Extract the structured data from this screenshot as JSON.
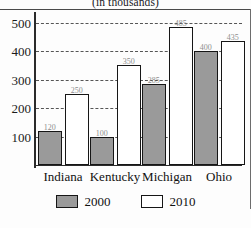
{
  "subtitle": "(in thousands)",
  "legend": [
    {
      "label": "2000",
      "swatch": "filled-gray-swatch"
    },
    {
      "label": "2010",
      "swatch": "empty-white-swatch"
    }
  ],
  "chart_data": {
    "type": "bar",
    "title": "",
    "subtitle": "(in thousands)",
    "categories": [
      "Indiana",
      "Kentucky",
      "Michigan",
      "Ohio"
    ],
    "series": [
      {
        "name": "2000",
        "values": [
          120,
          100,
          285,
          400
        ],
        "color": "#9a9a9a"
      },
      {
        "name": "2010",
        "values": [
          250,
          350,
          485,
          435
        ],
        "color": "#ffffff"
      }
    ],
    "xlabel": "",
    "ylabel": "",
    "ylim": [
      0,
      530
    ],
    "yticks": [
      100,
      200,
      300,
      400,
      500
    ],
    "ytick_labels": [
      "100",
      "200",
      "300",
      "400",
      "500"
    ],
    "grid": true,
    "grid_style": "dashed-horizontal",
    "legend_position": "bottom-center",
    "value_labels": true
  }
}
